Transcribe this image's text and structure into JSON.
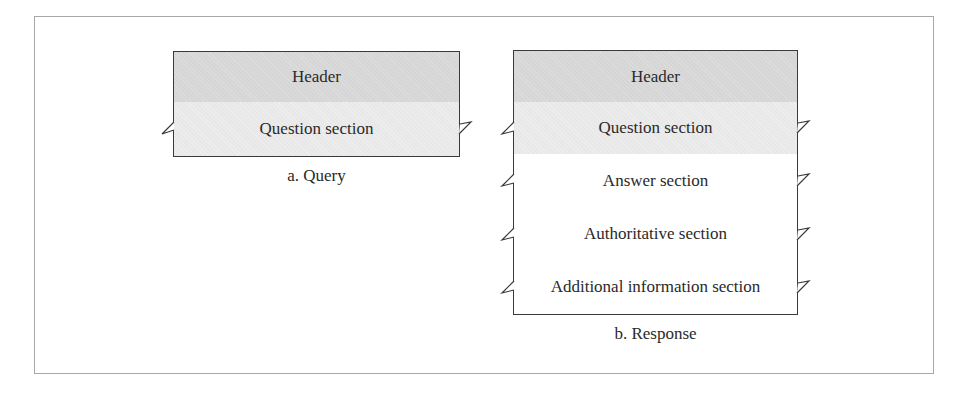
{
  "figure": {
    "query": {
      "rows": [
        {
          "label": "Header",
          "style": "header"
        },
        {
          "label": "Question section",
          "style": "question"
        }
      ],
      "caption": "a. Query"
    },
    "response": {
      "rows": [
        {
          "label": "Header",
          "style": "header"
        },
        {
          "label": "Question section",
          "style": "question"
        },
        {
          "label": "Answer section",
          "style": "plain"
        },
        {
          "label": "Authoritative section",
          "style": "plain"
        },
        {
          "label": "Additional information section",
          "style": "plain"
        }
      ],
      "caption": "b. Response"
    }
  },
  "colors": {
    "header_fill": "#d6d6d6",
    "question_fill": "#e8e8e8",
    "line": "#3a3a3a",
    "frame": "#a8a8a8"
  }
}
